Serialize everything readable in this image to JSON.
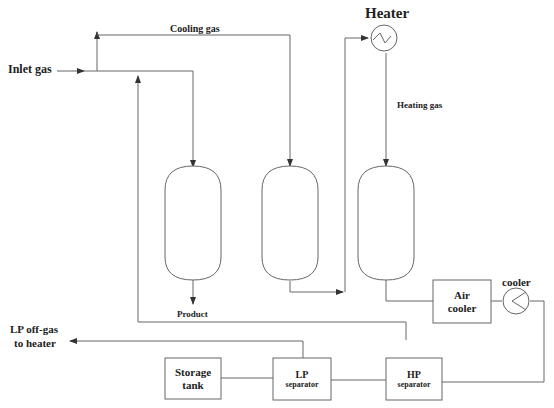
{
  "diagram": {
    "type": "process-flow-diagram",
    "labels": {
      "inlet_gas": "Inlet gas",
      "cooling_gas": "Cooling gas",
      "heater": "Heater",
      "heating_gas": "Heating gas",
      "product": "Product",
      "cooler": "cooler",
      "lp_offgas_line1": "LP off-gas",
      "lp_offgas_line2": "to heater"
    },
    "units": {
      "air_cooler": {
        "line1": "Air",
        "line2": "cooler"
      },
      "storage_tank": {
        "line1": "Storage",
        "line2": "tank"
      },
      "lp_separator": {
        "line1": "LP",
        "line2": "separator"
      },
      "hp_separator": {
        "line1": "HP",
        "line2": "separator"
      }
    },
    "vessels": [
      "adsorber-1",
      "adsorber-2",
      "adsorber-3"
    ],
    "colors": {
      "line": "#555555",
      "text": "#222222",
      "background": "#ffffff"
    }
  }
}
